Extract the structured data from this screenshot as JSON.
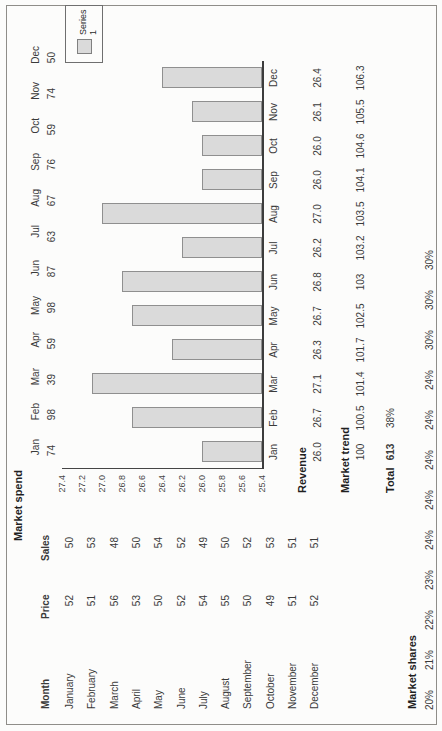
{
  "market_spend": {
    "title": "Market spend",
    "months": [
      "Jan",
      "Feb",
      "Mar",
      "Apr",
      "May",
      "Jun",
      "Jul",
      "Aug",
      "Sep",
      "Oct",
      "Nov",
      "Dec"
    ],
    "values": [
      "74",
      "98",
      "39",
      "59",
      "98",
      "87",
      "63",
      "67",
      "76",
      "59",
      "74",
      "50"
    ]
  },
  "table": {
    "headers": [
      "Month",
      "Price",
      "Sales"
    ],
    "rows": [
      [
        "January",
        "52",
        "50"
      ],
      [
        "February",
        "51",
        "53"
      ],
      [
        "March",
        "56",
        "48"
      ],
      [
        "April",
        "53",
        "50"
      ],
      [
        "May",
        "50",
        "54"
      ],
      [
        "June",
        "52",
        "52"
      ],
      [
        "July",
        "54",
        "49"
      ],
      [
        "August",
        "55",
        "50"
      ],
      [
        "September",
        "50",
        "52"
      ],
      [
        "October",
        "49",
        "53"
      ],
      [
        "November",
        "51",
        "51"
      ],
      [
        "December",
        "52",
        "51"
      ]
    ]
  },
  "chart_data": {
    "type": "bar",
    "title": "",
    "categories": [
      "Jan",
      "Feb",
      "Mar",
      "Apr",
      "May",
      "Jun",
      "Jul",
      "Aug",
      "Sep",
      "Oct",
      "Nov",
      "Dec"
    ],
    "series": [
      {
        "name": "Series 1",
        "values": [
          26.0,
          26.7,
          27.1,
          26.3,
          26.7,
          26.8,
          26.2,
          27.0,
          26.0,
          26.0,
          26.1,
          26.4
        ]
      }
    ],
    "xlabel": "",
    "ylabel": "",
    "ylim": [
      25.4,
      27.4
    ],
    "ytick_step": 0.2,
    "ytick_labels": [
      "25.4",
      "25.6",
      "25.8",
      "26.0",
      "26.2",
      "26.4",
      "26.6",
      "26.8",
      "27.0",
      "27.2",
      "27.4"
    ],
    "grid": false,
    "legend_position": "right",
    "bar_fill": "#dadada",
    "bar_border": "#8f8f8f"
  },
  "revenue": {
    "label": "Revenue",
    "values": [
      "26.0",
      "26.7",
      "27.1",
      "26.3",
      "26.7",
      "26.8",
      "26.2",
      "27.0",
      "26.0",
      "26.0",
      "26.1",
      "26.4"
    ]
  },
  "market_trend": {
    "label": "Market trend",
    "values": [
      "100",
      "100.5",
      "101.4",
      "101.7",
      "102.5",
      "103",
      "103.2",
      "103.5",
      "104.1",
      "104.6",
      "105.5",
      "106.3"
    ]
  },
  "total": {
    "label": "Total",
    "value": "613",
    "share": "38%"
  },
  "market_shares": {
    "label": "Market shares",
    "values": [
      "20%",
      "21%",
      "22%",
      "23%",
      "24%",
      "24%",
      "24%",
      "24%",
      "24%",
      "30%",
      "30%",
      "30%"
    ]
  }
}
